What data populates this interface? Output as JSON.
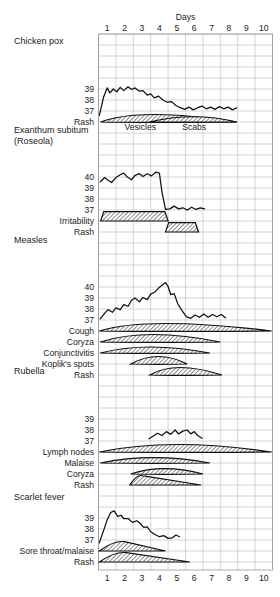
{
  "chart_data": {
    "type": "line",
    "title": "",
    "xlabel": "Days",
    "ylabel": "Temperature (°C)",
    "xtick_labels": [
      "1",
      "2",
      "3",
      "4",
      "5",
      "6",
      "7",
      "8",
      "9",
      "10"
    ],
    "x": [
      1,
      2,
      3,
      4,
      5,
      6,
      7,
      8,
      9,
      10
    ],
    "xlim": [
      0.5,
      10.5
    ],
    "grid": true,
    "legend": "none",
    "panels": [
      {
        "name": "Chicken pox",
        "ytick_labels": [
          "39",
          "38",
          "37"
        ],
        "ylim": [
          36.4,
          39.8
        ],
        "temperature": {
          "name": "Temperature",
          "points": [
            [
              0.55,
              36.6
            ],
            [
              0.8,
              38.3
            ],
            [
              1.0,
              39.1
            ],
            [
              1.15,
              38.65
            ],
            [
              1.35,
              39.0
            ],
            [
              1.55,
              38.75
            ],
            [
              1.75,
              39.15
            ],
            [
              1.95,
              38.85
            ],
            [
              2.2,
              39.2
            ],
            [
              2.4,
              38.95
            ],
            [
              2.6,
              39.1
            ],
            [
              2.85,
              38.8
            ],
            [
              3.05,
              38.85
            ],
            [
              3.3,
              38.45
            ],
            [
              3.5,
              38.55
            ],
            [
              3.7,
              38.2
            ],
            [
              3.95,
              38.35
            ],
            [
              4.2,
              38.0
            ],
            [
              4.45,
              37.8
            ],
            [
              4.7,
              37.85
            ],
            [
              4.95,
              37.5
            ],
            [
              5.2,
              37.3
            ],
            [
              5.45,
              37.15
            ],
            [
              5.7,
              37.35
            ],
            [
              5.95,
              37.1
            ],
            [
              6.2,
              37.3
            ],
            [
              6.45,
              37.45
            ],
            [
              6.7,
              37.2
            ],
            [
              6.95,
              37.35
            ],
            [
              7.2,
              37.15
            ],
            [
              7.45,
              37.4
            ],
            [
              7.7,
              37.2
            ],
            [
              7.95,
              37.35
            ],
            [
              8.2,
              37.1
            ],
            [
              8.45,
              37.3
            ]
          ]
        },
        "rows": [
          {
            "label": "Rash",
            "bands": [
              {
                "name": "Vesicles",
                "shape": "lens",
                "start": 0.62,
                "end": 8.45,
                "peak": 2.9,
                "height": 1.0,
                "inline_label": "Vesicles"
              },
              {
                "name": "Scabs",
                "shape": "lens-right",
                "start": 3.4,
                "end": 8.45,
                "peak": 6.0,
                "height": 0.72,
                "inline_label": "Scabs"
              }
            ]
          }
        ]
      },
      {
        "name": "Exanthum subitum",
        "name2": "(Roseola)",
        "ytick_labels": [
          "40",
          "39",
          "38",
          "37"
        ],
        "ylim": [
          36.4,
          40.6
        ],
        "temperature": {
          "name": "Temperature",
          "points": [
            [
              0.6,
              39.55
            ],
            [
              0.85,
              39.95
            ],
            [
              1.05,
              39.7
            ],
            [
              1.25,
              39.5
            ],
            [
              1.5,
              39.95
            ],
            [
              1.75,
              40.2
            ],
            [
              1.95,
              40.35
            ],
            [
              2.15,
              40.0
            ],
            [
              2.4,
              39.75
            ],
            [
              2.6,
              40.15
            ],
            [
              2.85,
              40.3
            ],
            [
              3.05,
              40.05
            ],
            [
              3.3,
              40.3
            ],
            [
              3.55,
              40.1
            ],
            [
              3.8,
              40.45
            ],
            [
              4.0,
              40.35
            ],
            [
              4.15,
              38.6
            ],
            [
              4.35,
              37.05
            ],
            [
              4.6,
              37.1
            ],
            [
              4.85,
              37.35
            ],
            [
              5.1,
              37.1
            ],
            [
              5.35,
              37.2
            ],
            [
              5.6,
              37.0
            ],
            [
              5.85,
              37.25
            ],
            [
              6.1,
              37.05
            ],
            [
              6.35,
              37.2
            ],
            [
              6.6,
              37.1
            ]
          ]
        },
        "rows": [
          {
            "label": "Irritability",
            "bands": [
              {
                "name": "Irritability",
                "shape": "trapezoid",
                "start": 0.62,
                "end": 4.5,
                "height": 1.0
              }
            ]
          },
          {
            "label": "Rash",
            "bands": [
              {
                "name": "Rash",
                "shape": "trapezoid",
                "start": 4.35,
                "end": 6.25,
                "height": 1.0
              }
            ]
          }
        ]
      },
      {
        "name": "Measles",
        "ytick_labels": [
          "40",
          "39",
          "38",
          "37"
        ],
        "ylim": [
          36.4,
          40.6
        ],
        "temperature": {
          "name": "Temperature",
          "points": [
            [
              0.6,
              37.1
            ],
            [
              0.85,
              37.6
            ],
            [
              1.05,
              37.95
            ],
            [
              1.3,
              37.7
            ],
            [
              1.5,
              38.1
            ],
            [
              1.75,
              37.95
            ],
            [
              1.95,
              38.4
            ],
            [
              2.2,
              38.25
            ],
            [
              2.4,
              38.8
            ],
            [
              2.6,
              39.0
            ],
            [
              2.85,
              38.65
            ],
            [
              3.05,
              39.05
            ],
            [
              3.3,
              38.85
            ],
            [
              3.5,
              39.35
            ],
            [
              3.75,
              39.55
            ],
            [
              3.95,
              39.9
            ],
            [
              4.15,
              40.15
            ],
            [
              4.35,
              40.4
            ],
            [
              4.5,
              40.05
            ],
            [
              4.65,
              39.3
            ],
            [
              4.85,
              39.4
            ],
            [
              5.05,
              38.5
            ],
            [
              5.3,
              37.85
            ],
            [
              5.55,
              37.3
            ],
            [
              5.8,
              37.15
            ],
            [
              6.05,
              37.45
            ],
            [
              6.3,
              37.25
            ],
            [
              6.55,
              37.55
            ],
            [
              6.8,
              37.25
            ],
            [
              7.05,
              37.5
            ],
            [
              7.3,
              37.3
            ],
            [
              7.55,
              37.5
            ],
            [
              7.8,
              37.2
            ]
          ]
        },
        "rows": [
          {
            "label": "Cough",
            "bands": [
              {
                "name": "Cough",
                "shape": "lens",
                "start": 0.55,
                "end": 10.45,
                "peak": 3.3,
                "height": 1.0
              }
            ]
          },
          {
            "label": "Coryza",
            "bands": [
              {
                "name": "Coryza",
                "shape": "lens",
                "start": 0.6,
                "end": 7.5,
                "peak": 3.3,
                "height": 1.0
              }
            ]
          },
          {
            "label": "Conjunctivitis",
            "bands": [
              {
                "name": "Conjunctivitis",
                "shape": "lens",
                "start": 0.6,
                "end": 6.9,
                "peak": 3.3,
                "height": 0.8
              }
            ]
          },
          {
            "label": "Koplik's spots",
            "bands": [
              {
                "name": "Koplik's spots",
                "shape": "lens",
                "start": 2.35,
                "end": 5.6,
                "peak": 3.9,
                "height": 1.0
              }
            ]
          },
          {
            "label": "Rash",
            "bands": [
              {
                "name": "Rash",
                "shape": "lens",
                "start": 3.45,
                "end": 7.6,
                "peak": 4.9,
                "height": 1.0
              }
            ]
          }
        ]
      },
      {
        "name": "Rubella",
        "ytick_labels": [
          "39",
          "38",
          "37"
        ],
        "ylim": [
          36.4,
          39.8
        ],
        "temperature": {
          "name": "Temperature",
          "points": [
            [
              3.4,
              37.2
            ],
            [
              3.65,
              37.45
            ],
            [
              3.9,
              37.7
            ],
            [
              4.15,
              37.5
            ],
            [
              4.4,
              37.85
            ],
            [
              4.65,
              37.6
            ],
            [
              4.9,
              38.0
            ],
            [
              5.1,
              37.65
            ],
            [
              5.35,
              37.9
            ],
            [
              5.6,
              38.0
            ],
            [
              5.8,
              37.65
            ],
            [
              6.0,
              37.85
            ],
            [
              6.2,
              37.5
            ],
            [
              6.45,
              37.25
            ]
          ]
        },
        "rows": [
          {
            "label": "Lymph nodes",
            "bands": [
              {
                "name": "Lymph nodes",
                "shape": "lens",
                "start": 0.55,
                "end": 10.45,
                "peak": 4.6,
                "height": 1.0
              }
            ]
          },
          {
            "label": "Malaise",
            "bands": [
              {
                "name": "Malaise",
                "shape": "lens",
                "start": 0.6,
                "end": 6.9,
                "peak": 3.6,
                "height": 0.72
              }
            ]
          },
          {
            "label": "Coryza",
            "bands": [
              {
                "name": "Coryza",
                "shape": "lens",
                "start": 2.35,
                "end": 6.5,
                "peak": 4.2,
                "height": 0.72
              }
            ]
          },
          {
            "label": "Rash",
            "bands": [
              {
                "name": "Rash",
                "shape": "wedge",
                "start": 2.3,
                "end": 6.4,
                "peak": 3.0,
                "height": 1.0
              }
            ]
          }
        ]
      },
      {
        "name": "Scarlet fever",
        "ytick_labels": [
          "39",
          "38",
          "37"
        ],
        "ylim": [
          36.4,
          39.8
        ],
        "temperature": {
          "name": "Temperature",
          "points": [
            [
              0.55,
              36.75
            ],
            [
              0.8,
              37.9
            ],
            [
              1.0,
              38.85
            ],
            [
              1.2,
              39.5
            ],
            [
              1.4,
              39.65
            ],
            [
              1.6,
              39.15
            ],
            [
              1.8,
              39.25
            ],
            [
              1.95,
              38.95
            ],
            [
              2.2,
              38.95
            ],
            [
              2.45,
              38.6
            ],
            [
              2.7,
              38.75
            ],
            [
              2.9,
              38.5
            ],
            [
              3.1,
              38.15
            ],
            [
              3.3,
              38.2
            ],
            [
              3.5,
              37.75
            ],
            [
              3.75,
              37.5
            ],
            [
              4.0,
              37.3
            ],
            [
              4.25,
              37.4
            ],
            [
              4.5,
              37.15
            ],
            [
              4.75,
              37.2
            ],
            [
              4.95,
              37.45
            ],
            [
              5.15,
              37.3
            ]
          ]
        },
        "rows": [
          {
            "label": "Sore throat/malaise",
            "bands": [
              {
                "name": "Sore throat/malaise",
                "shape": "wedge",
                "start": 0.55,
                "end": 4.35,
                "peak": 2.0,
                "height": 1.0
              }
            ]
          },
          {
            "label": "Rash",
            "bands": [
              {
                "name": "Rash",
                "shape": "wedge",
                "start": 0.55,
                "end": 5.75,
                "peak": 2.1,
                "height": 1.0
              }
            ]
          }
        ]
      }
    ]
  },
  "axis": {
    "days_title": "Days"
  }
}
